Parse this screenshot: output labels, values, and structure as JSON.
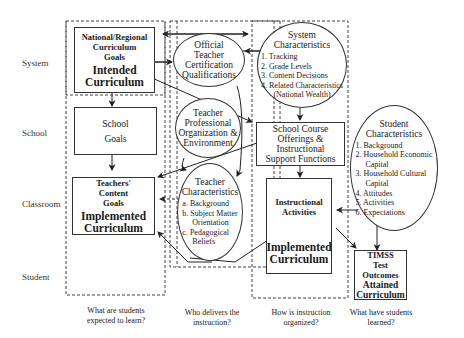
{
  "row_labels": [
    "System",
    "School",
    "Classroom",
    "Student"
  ],
  "column_questions": [
    "What are students expected to learn?",
    "Who delivers the instruction?",
    "How is instruction organized?",
    "What have students learned?"
  ],
  "nodes": {
    "national_goals": {
      "title": "National/Regional Curriculum Goals",
      "line1": "National/Regional",
      "line2": "Curriculum",
      "line3": "Goals",
      "label": "Intended Curriculum",
      "label1": "Intended",
      "label2": "Curriculum"
    },
    "school_goals": {
      "line1": "School",
      "line2": "Goals"
    },
    "teachers_goals": {
      "line1": "Teachers'",
      "line2": "Content",
      "line3": "Goals",
      "label1": "Implemented",
      "label2": "Curriculum"
    },
    "official_cert": {
      "line1": "Official",
      "line2": "Teacher",
      "line3": "Certification",
      "line4": "Qualifications"
    },
    "teacher_prof": {
      "line1": "Teacher",
      "line2": "Professional",
      "line3": "Organization &",
      "line4": "Environment"
    },
    "teacher_char": {
      "line1": "Teacher",
      "line2": "Characteristics",
      "items": [
        "a.  Background",
        "b.  Subject Matter",
        "     Orientation",
        "c.  Pedagogical",
        "     Beliefs"
      ]
    },
    "system_char": {
      "line1": "System",
      "line2": "Characteristics",
      "items": [
        "1.  Tracking",
        "2.  Grade Levels",
        "3.  Content Decisions",
        "4.  Related Characteristics",
        "(National Wealth)"
      ]
    },
    "school_course": {
      "line1": "School Course",
      "line2": "Offerings &",
      "line3": "Instructional",
      "line4": "Support Functions"
    },
    "instructional": {
      "line1": "Instructional",
      "line2": "Activities",
      "label1": "Implemented",
      "label2": "Curriculum"
    },
    "student_char": {
      "line1": "Student",
      "line2": "Characteristics",
      "items": [
        "1.  Background",
        "2.  Household Economic",
        "     Capital",
        "3.  Household Cultural",
        "     Capital",
        "4.  Attitudes",
        "5.  Activities",
        "6.  Expectations"
      ]
    },
    "timss": {
      "line1": "TIMSS",
      "line2": "Test",
      "line3": "Outcomes",
      "label1": "Attained",
      "label2": "Curriculum"
    }
  },
  "colors": {
    "line": "#333333",
    "background": "#ffffff",
    "text": "#1a1a1a"
  }
}
